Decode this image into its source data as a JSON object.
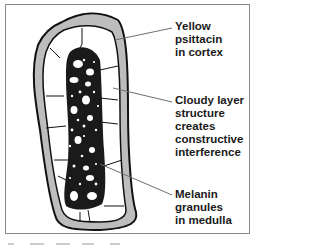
{
  "figure": {
    "colors": {
      "cortex": "#bdbdbd",
      "outline": "#111111",
      "leader_line": "#6e6e6e",
      "frame": "#8a8a8a",
      "background": "#ffffff"
    }
  },
  "labels": [
    {
      "id": "cortex",
      "text": "Yellow\npsittacin\nin cortex"
    },
    {
      "id": "cloudy",
      "text": "Cloudy layer\nstructure\ncreates\nconstructive\ninterference"
    },
    {
      "id": "medulla",
      "text": "Melanin\ngranules\nin medulla"
    }
  ],
  "regions": [
    {
      "id": "cortex",
      "description": "grey outer ring"
    },
    {
      "id": "cloudy-layer",
      "description": "white cell layer between cortex and medulla"
    },
    {
      "id": "medulla",
      "description": "dark speckled central column with vacuoles"
    }
  ]
}
